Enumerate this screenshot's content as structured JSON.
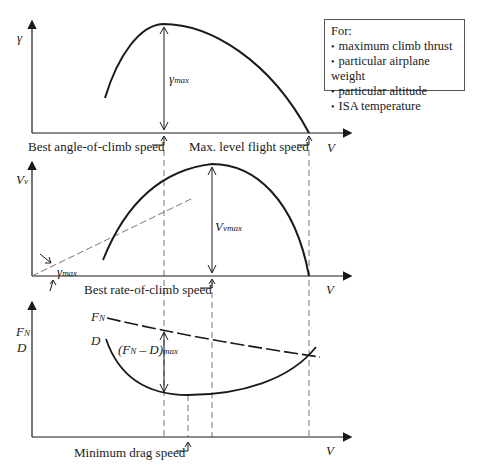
{
  "legend": {
    "title": "For:",
    "items": [
      "maximum climb thrust",
      "particular airplane weight",
      "particular altitude",
      "ISA temperature"
    ]
  },
  "panels": {
    "top": {
      "y_label": "γ",
      "x_label": "V",
      "annotation": "γ",
      "annotation_sub": "max",
      "speed_labels": [
        "Best angle-of-climb speed",
        "Max. level flight speed"
      ]
    },
    "middle": {
      "y_label": "V",
      "y_label_sub": "v",
      "x_label": "V",
      "annotation": "V",
      "annotation_sub": "vmax",
      "angle_label": "γ",
      "angle_label_sub": "max",
      "speed_labels": [
        "Best rate-of-climb speed"
      ]
    },
    "bottom": {
      "y_label_1": "F",
      "y_label_1_sub": "N",
      "y_label_2": "D",
      "x_label": "V",
      "curve_fn": "F",
      "curve_fn_sub": "N",
      "curve_d": "D",
      "annotation_pre": "(F",
      "annotation_sub1": "N",
      "annotation_mid": " – D)",
      "annotation_sub2": "max",
      "speed_labels": [
        "Minimum drag speed"
      ]
    }
  },
  "colors": {
    "line": "#1a1a1a",
    "dashed": "#777777",
    "background": "#ffffff"
  }
}
